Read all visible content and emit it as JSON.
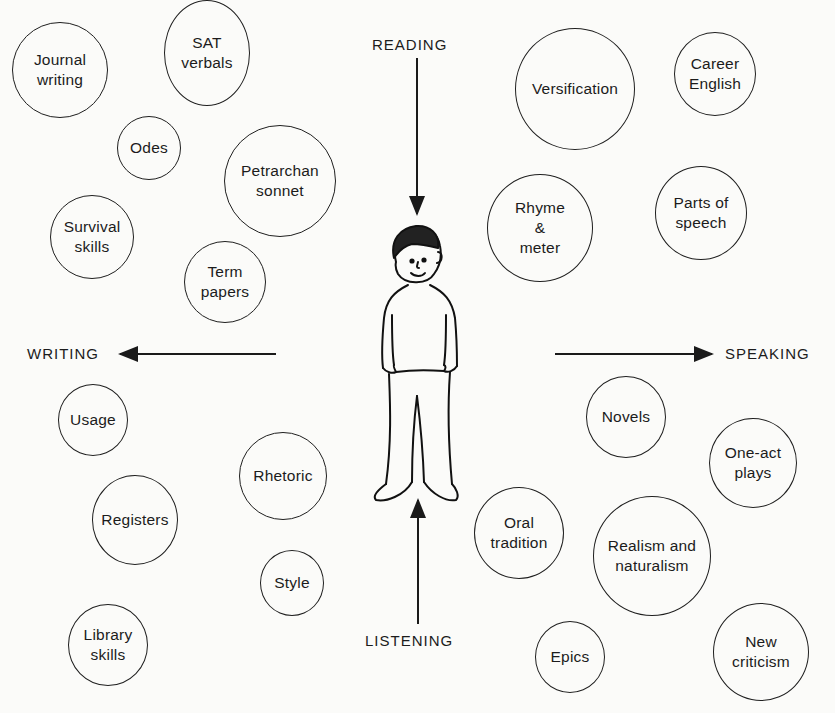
{
  "diagram": {
    "center_figure": "child-figure",
    "skills": {
      "reading": "READING",
      "writing": "WRITING",
      "speaking": "SPEAKING",
      "listening": "LISTENING"
    },
    "topics": [
      {
        "id": "journal-writing",
        "label": "Journal\nwriting"
      },
      {
        "id": "sat-verbals",
        "label": "SAT\nverbals"
      },
      {
        "id": "odes",
        "label": "Odes"
      },
      {
        "id": "petrarchan-sonnet",
        "label": "Petrarchan\nsonnet"
      },
      {
        "id": "survival-skills",
        "label": "Survival\nskills"
      },
      {
        "id": "term-papers",
        "label": "Term\npapers"
      },
      {
        "id": "versification",
        "label": "Versification"
      },
      {
        "id": "career-english",
        "label": "Career\nEnglish"
      },
      {
        "id": "rhyme-meter",
        "label": "Rhyme\n&\nmeter"
      },
      {
        "id": "parts-of-speech",
        "label": "Parts of\nspeech"
      },
      {
        "id": "usage",
        "label": "Usage"
      },
      {
        "id": "rhetoric",
        "label": "Rhetoric"
      },
      {
        "id": "registers",
        "label": "Registers"
      },
      {
        "id": "style",
        "label": "Style"
      },
      {
        "id": "library-skills",
        "label": "Library\nskills"
      },
      {
        "id": "novels",
        "label": "Novels"
      },
      {
        "id": "one-act-plays",
        "label": "One-act\nplays"
      },
      {
        "id": "oral-tradition",
        "label": "Oral\ntradition"
      },
      {
        "id": "realism-naturalism",
        "label": "Realism and\nnaturalism"
      },
      {
        "id": "epics",
        "label": "Epics"
      },
      {
        "id": "new-criticism",
        "label": "New\ncriticism"
      }
    ]
  }
}
